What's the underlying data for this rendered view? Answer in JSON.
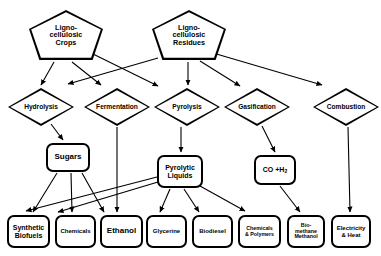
{
  "diagram": {
    "background": "#ffffff",
    "line_color": "#000000",
    "nodes": [
      {
        "id": "crops",
        "label": "Ligno-\ncellulosic\nCrops",
        "shape": "pentagon",
        "x": 29,
        "y": 10,
        "w": 74,
        "h": 50
      },
      {
        "id": "residues",
        "label": "Ligno-\ncellulosic\nResidues",
        "shape": "pentagon",
        "x": 152,
        "y": 10,
        "w": 74,
        "h": 50
      },
      {
        "id": "hydrolysis",
        "label": "Hydrolysis",
        "shape": "diamond",
        "x": 8,
        "y": 88,
        "w": 66,
        "h": 38
      },
      {
        "id": "fermentation",
        "label": "Fermentation",
        "shape": "diamond",
        "x": 84,
        "y": 88,
        "w": 66,
        "h": 38
      },
      {
        "id": "pyrolysis",
        "label": "Pyrolysis",
        "shape": "diamond",
        "x": 154,
        "y": 88,
        "w": 66,
        "h": 38
      },
      {
        "id": "gasification",
        "label": "Gasification",
        "shape": "diamond",
        "x": 224,
        "y": 88,
        "w": 66,
        "h": 38
      },
      {
        "id": "combustion",
        "label": "Combustion",
        "shape": "diamond",
        "x": 313,
        "y": 88,
        "w": 66,
        "h": 38
      },
      {
        "id": "sugars",
        "label": "Sugars",
        "shape": "rrect",
        "x": 46,
        "y": 143,
        "w": 44,
        "h": 29,
        "size": "big"
      },
      {
        "id": "pyroliquids",
        "label": "Pyrolytic\nLiquids",
        "shape": "rrect",
        "x": 157,
        "y": 155,
        "w": 46,
        "h": 33
      },
      {
        "id": "coh2",
        "label": "CO +H2",
        "shape": "rrect",
        "x": 254,
        "y": 155,
        "w": 42,
        "h": 30,
        "html": "CO +H<sub>2</sub>"
      },
      {
        "id": "synthbio",
        "label": "Synthetic\nBiofuels",
        "shape": "rrect",
        "x": 7,
        "y": 215,
        "w": 43,
        "h": 33
      },
      {
        "id": "chemicals",
        "label": "Chemicals",
        "shape": "rrect",
        "x": 55,
        "y": 215,
        "w": 41,
        "h": 33,
        "size": "small"
      },
      {
        "id": "ethanol",
        "label": "Ethanol",
        "shape": "rrect",
        "x": 100,
        "y": 215,
        "w": 43,
        "h": 33,
        "size": "big"
      },
      {
        "id": "glycerine",
        "label": "Glycerine",
        "shape": "rrect",
        "x": 146,
        "y": 215,
        "w": 41,
        "h": 33,
        "size": "small"
      },
      {
        "id": "biodiesel",
        "label": "Biodiesel",
        "shape": "rrect",
        "x": 192,
        "y": 215,
        "w": 41,
        "h": 33,
        "size": "small"
      },
      {
        "id": "chempoly",
        "label": "Chemicals\n& Polymers",
        "shape": "rrect",
        "x": 238,
        "y": 215,
        "w": 43,
        "h": 33,
        "size": "tiny"
      },
      {
        "id": "biomethane",
        "label": "Bio-\nmethane\nMethanol",
        "shape": "rrect",
        "x": 287,
        "y": 215,
        "w": 38,
        "h": 33,
        "size": "tiny"
      },
      {
        "id": "electricity",
        "label": "Electricity\n& Heat",
        "shape": "rrect",
        "x": 331,
        "y": 215,
        "w": 40,
        "h": 33,
        "size": "small"
      }
    ],
    "edges": [
      {
        "from": "crops",
        "to": "hydrolysis",
        "x1": 54,
        "y1": 62,
        "x2": 41,
        "y2": 85
      },
      {
        "from": "crops",
        "to": "fermentation",
        "x1": 72,
        "y1": 62,
        "x2": 101,
        "y2": 85
      },
      {
        "from": "crops",
        "to": "pyrolysis",
        "x1": 91,
        "y1": 53,
        "x2": 158,
        "y2": 86
      },
      {
        "from": "residues",
        "to": "fermentation",
        "x1": 158,
        "y1": 58,
        "x2": 68,
        "y2": 84
      },
      {
        "from": "residues",
        "to": "pyrolysis",
        "x1": 188,
        "y1": 62,
        "x2": 188,
        "y2": 85
      },
      {
        "from": "residues",
        "to": "gasification",
        "x1": 200,
        "y1": 61,
        "x2": 240,
        "y2": 86
      },
      {
        "from": "residues",
        "to": "combustion",
        "x1": 213,
        "y1": 53,
        "x2": 322,
        "y2": 85
      },
      {
        "from": "hydrolysis",
        "to": "sugars",
        "x1": 51,
        "y1": 124,
        "x2": 63,
        "y2": 140
      },
      {
        "from": "fermentation",
        "to": "ethanol",
        "x1": 117,
        "y1": 127,
        "x2": 117,
        "y2": 212
      },
      {
        "from": "pyrolysis",
        "to": "pyroliquids",
        "x1": 181,
        "y1": 127,
        "x2": 181,
        "y2": 152
      },
      {
        "from": "gasification",
        "to": "coh2",
        "x1": 262,
        "y1": 126,
        "x2": 275,
        "y2": 152
      },
      {
        "from": "combustion",
        "to": "electricity",
        "x1": 348,
        "y1": 127,
        "x2": 350,
        "y2": 212
      },
      {
        "from": "sugars",
        "to": "synthbio",
        "x1": 57,
        "y1": 173,
        "x2": 33,
        "y2": 212
      },
      {
        "from": "sugars",
        "to": "chemicals",
        "x1": 71,
        "y1": 173,
        "x2": 72,
        "y2": 212
      },
      {
        "from": "sugars",
        "to": "ethanol",
        "x1": 82,
        "y1": 173,
        "x2": 104,
        "y2": 212
      },
      {
        "from": "pyroliquids",
        "to": "synthbio",
        "x1": 157,
        "y1": 177,
        "x2": 26,
        "y2": 211
      },
      {
        "from": "pyroliquids",
        "to": "chemicals",
        "x1": 158,
        "y1": 182,
        "x2": 58,
        "y2": 212
      },
      {
        "from": "pyroliquids",
        "to": "glycerine",
        "x1": 170,
        "y1": 189,
        "x2": 160,
        "y2": 212
      },
      {
        "from": "pyroliquids",
        "to": "biodiesel",
        "x1": 184,
        "y1": 189,
        "x2": 199,
        "y2": 212
      },
      {
        "from": "pyroliquids",
        "to": "chempoly",
        "x1": 200,
        "y1": 186,
        "x2": 245,
        "y2": 211
      },
      {
        "from": "coh2",
        "to": "biomethane",
        "x1": 280,
        "y1": 186,
        "x2": 300,
        "y2": 212
      }
    ]
  }
}
